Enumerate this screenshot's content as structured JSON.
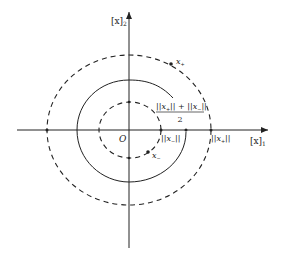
{
  "diagram": {
    "axes": {
      "x_label": "[x]",
      "x_label_sub": "1",
      "y_label": "[x]",
      "y_label_sub": "2",
      "origin_label": "O"
    },
    "curves": [
      {
        "name": "outer-dashed-circle",
        "style": "dashed",
        "radius_label": "||x+||"
      },
      {
        "name": "middle-solid-spiral",
        "style": "solid",
        "radius_label": "(||x+|| + ||x-||)/2"
      },
      {
        "name": "inner-dashed-circle",
        "style": "dashed",
        "radius_label": "||x-||"
      }
    ],
    "points": {
      "x_plus": "x",
      "x_plus_sub": "+",
      "x_minus": "x",
      "x_minus_sub": "−"
    },
    "labels": {
      "norm_x_minus": "||x",
      "norm_x_minus_sub": "−",
      "norm_x_minus_close": "||",
      "norm_x_plus": "||x",
      "norm_x_plus_sub": "+",
      "norm_x_plus_close": "||",
      "avg_numerator": "||x",
      "avg_num_sub1": "+",
      "avg_num_mid": "|| + ||x",
      "avg_num_sub2": "−",
      "avg_num_close": "||",
      "avg_denominator": "2"
    },
    "colors": {
      "stroke": "#222222",
      "background": "#ffffff"
    }
  }
}
